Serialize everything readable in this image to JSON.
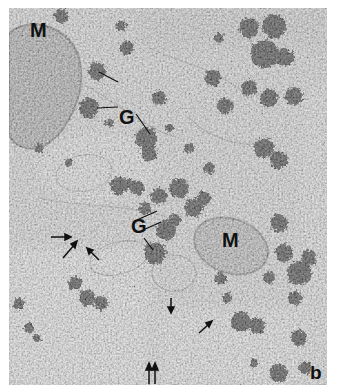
{
  "figure": {
    "panel_label": "b",
    "type": "electron micrograph",
    "labels": {
      "mitochondrion_top_left": "M",
      "mitochondrion_center_right": "M",
      "golgi_upper": "G",
      "golgi_lower": "G"
    },
    "arrows": {
      "single_arrows_count": 5,
      "double_arrow": "↑↑"
    },
    "colors": {
      "background": "#ffffff",
      "tissue_base": "#cfcfcf",
      "granule": "#111111",
      "label": "#111111"
    }
  }
}
